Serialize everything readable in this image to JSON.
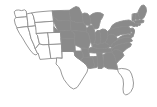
{
  "map": {
    "title": "United States choropleth map",
    "type": "choropleth",
    "region": "contiguous-united-states",
    "projection": "albers-usa",
    "background_color": "#ffffff",
    "border_color": "#8d8d8d",
    "legend": {
      "visible": false,
      "categories": [
        {
          "key": "shaded",
          "label": "Selected",
          "color": "#8a8a8a"
        },
        {
          "key": "unshaded",
          "label": "Not selected",
          "color": "#ffffff"
        }
      ]
    },
    "labels_visible": false,
    "states": [
      {
        "code": "WA",
        "name": "Washington",
        "value": "unshaded"
      },
      {
        "code": "OR",
        "name": "Oregon",
        "value": "unshaded"
      },
      {
        "code": "CA",
        "name": "California",
        "value": "unshaded"
      },
      {
        "code": "NV",
        "name": "Nevada",
        "value": "unshaded"
      },
      {
        "code": "ID",
        "name": "Idaho",
        "value": "unshaded"
      },
      {
        "code": "MT",
        "name": "Montana",
        "value": "unshaded"
      },
      {
        "code": "WY",
        "name": "Wyoming",
        "value": "unshaded"
      },
      {
        "code": "UT",
        "name": "Utah",
        "value": "unshaded"
      },
      {
        "code": "AZ",
        "name": "Arizona",
        "value": "unshaded"
      },
      {
        "code": "CO",
        "name": "Colorado",
        "value": "unshaded"
      },
      {
        "code": "NM",
        "name": "New Mexico",
        "value": "unshaded"
      },
      {
        "code": "TX",
        "name": "Texas",
        "value": "unshaded"
      },
      {
        "code": "ND",
        "name": "North Dakota",
        "value": "shaded"
      },
      {
        "code": "SD",
        "name": "South Dakota",
        "value": "shaded"
      },
      {
        "code": "NE",
        "name": "Nebraska",
        "value": "shaded"
      },
      {
        "code": "KS",
        "name": "Kansas",
        "value": "shaded"
      },
      {
        "code": "OK",
        "name": "Oklahoma",
        "value": "shaded"
      },
      {
        "code": "MN",
        "name": "Minnesota",
        "value": "shaded"
      },
      {
        "code": "IA",
        "name": "Iowa",
        "value": "shaded"
      },
      {
        "code": "MO",
        "name": "Missouri",
        "value": "shaded"
      },
      {
        "code": "AR",
        "name": "Arkansas",
        "value": "shaded"
      },
      {
        "code": "LA",
        "name": "Louisiana",
        "value": "shaded"
      },
      {
        "code": "WI",
        "name": "Wisconsin",
        "value": "shaded"
      },
      {
        "code": "IL",
        "name": "Illinois",
        "value": "shaded"
      },
      {
        "code": "MS",
        "name": "Mississippi",
        "value": "shaded"
      },
      {
        "code": "MI",
        "name": "Michigan",
        "value": "shaded"
      },
      {
        "code": "IN",
        "name": "Indiana",
        "value": "shaded"
      },
      {
        "code": "OH",
        "name": "Ohio",
        "value": "shaded"
      },
      {
        "code": "KY",
        "name": "Kentucky",
        "value": "shaded"
      },
      {
        "code": "TN",
        "name": "Tennessee",
        "value": "shaded"
      },
      {
        "code": "AL",
        "name": "Alabama",
        "value": "shaded"
      },
      {
        "code": "GA",
        "name": "Georgia",
        "value": "shaded"
      },
      {
        "code": "FL",
        "name": "Florida",
        "value": "unshaded"
      },
      {
        "code": "SC",
        "name": "South Carolina",
        "value": "shaded"
      },
      {
        "code": "NC",
        "name": "North Carolina",
        "value": "shaded"
      },
      {
        "code": "VA",
        "name": "Virginia",
        "value": "shaded"
      },
      {
        "code": "WV",
        "name": "West Virginia",
        "value": "shaded"
      },
      {
        "code": "MD",
        "name": "Maryland",
        "value": "shaded"
      },
      {
        "code": "DE",
        "name": "Delaware",
        "value": "shaded"
      },
      {
        "code": "PA",
        "name": "Pennsylvania",
        "value": "shaded"
      },
      {
        "code": "NJ",
        "name": "New Jersey",
        "value": "shaded"
      },
      {
        "code": "NY",
        "name": "New York",
        "value": "shaded"
      },
      {
        "code": "CT",
        "name": "Connecticut",
        "value": "shaded"
      },
      {
        "code": "RI",
        "name": "Rhode Island",
        "value": "shaded"
      },
      {
        "code": "MA",
        "name": "Massachusetts",
        "value": "shaded"
      },
      {
        "code": "VT",
        "name": "Vermont",
        "value": "shaded"
      },
      {
        "code": "NH",
        "name": "New Hampshire",
        "value": "shaded"
      },
      {
        "code": "ME",
        "name": "Maine",
        "value": "shaded"
      }
    ]
  }
}
